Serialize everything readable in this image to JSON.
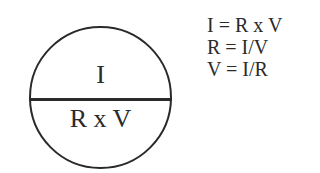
{
  "diagram": {
    "type": "ohms-law-triangle-circle",
    "circle": {
      "top_section": "I",
      "bottom_section": "R x V"
    },
    "formulas": [
      "I = R x V",
      "R = I/V",
      "V = I/R"
    ],
    "colors": {
      "stroke": "#2a2a2a",
      "background": "#ffffff",
      "text": "#2a2a2a"
    }
  }
}
